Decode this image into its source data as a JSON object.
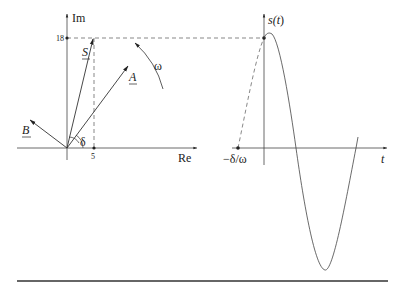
{
  "phasor_diagram": {
    "axes": {
      "real_label": "Re",
      "imag_label": "Im"
    },
    "ticks": {
      "imag_value": "18",
      "real_value": "5"
    },
    "phasors": [
      {
        "name": "S",
        "label": "S"
      },
      {
        "name": "A",
        "label": "A"
      },
      {
        "name": "B",
        "label": "B"
      }
    ],
    "angle_label": "δ",
    "rotation_label": "ω"
  },
  "time_plot": {
    "y_label_prefix": "s(",
    "y_label_var": "t",
    "y_label_suffix": ")",
    "x_label": "t",
    "phase_label": "−δ/ω"
  },
  "colors": {
    "line": "#333333",
    "dashed": "#555555",
    "text": "#222222"
  }
}
